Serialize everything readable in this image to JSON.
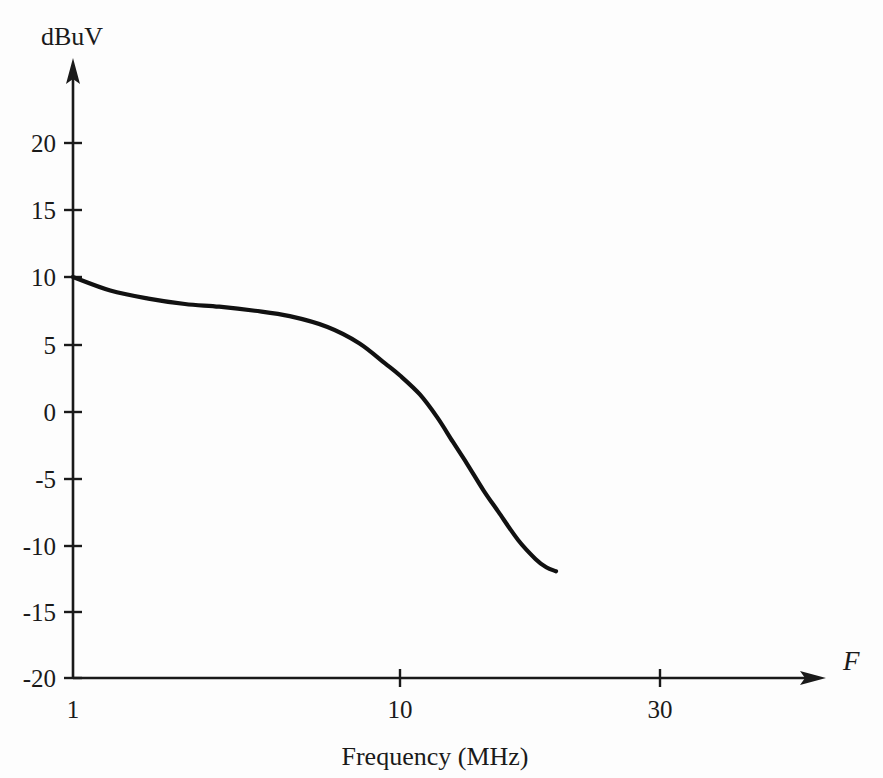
{
  "chart_data": {
    "type": "line",
    "title": "",
    "xlabel": "Frequency (MHz)",
    "ylabel": "dBuV",
    "x_axis_symbol": "F",
    "xscale": "log",
    "xlim": [
      1,
      30
    ],
    "ylim": [
      -20,
      22
    ],
    "grid": false,
    "legend": null,
    "x_tick_labels": [
      "1",
      "10",
      "30"
    ],
    "x_tick_values": [
      1,
      10,
      30
    ],
    "y_tick_labels": [
      "20",
      "15",
      "10",
      "5",
      "0",
      "-5",
      "-10",
      "-15",
      "-20"
    ],
    "y_tick_values": [
      20,
      15,
      10,
      5,
      0,
      -5,
      -10,
      -15,
      -20
    ],
    "series": [
      {
        "name": "response",
        "x": [
          1,
          1.3,
          1.7,
          2.2,
          2.8,
          3.6,
          4.6,
          6,
          7.5,
          9,
          10,
          11.5,
          13,
          14.5,
          16,
          18,
          20,
          23,
          26,
          28,
          30
        ],
        "values": [
          10.0,
          9.0,
          8.4,
          8.0,
          7.8,
          7.5,
          7.1,
          6.3,
          5.1,
          3.6,
          2.7,
          1.3,
          -0.4,
          -2.2,
          -3.8,
          -5.8,
          -7.4,
          -9.5,
          -10.9,
          -11.5,
          -11.8
        ]
      }
    ],
    "annotations": []
  },
  "colors": {
    "background": "#fdfdfd",
    "ink": "#1a1a1a",
    "curve": "#111111"
  },
  "geometry": {
    "x_axis_y": 678,
    "y_axis_x": 73,
    "x_pixels": {
      "1": 73,
      "10": 400,
      "30": 660
    },
    "y_pixels": {
      "20": 143,
      "15": 210,
      "10": 277,
      "5": 345,
      "0": 412,
      "-5": 479,
      "-10": 546,
      "-15": 612,
      "-20": 678
    },
    "y_axis_arrow_tip_y": 58,
    "x_axis_arrow_tip_x": 826,
    "tick_half_length": 9
  },
  "labels": {
    "y_axis_title": "dBuV",
    "x_axis_title": "Frequency (MHz)",
    "x_axis_symbol": "F"
  }
}
